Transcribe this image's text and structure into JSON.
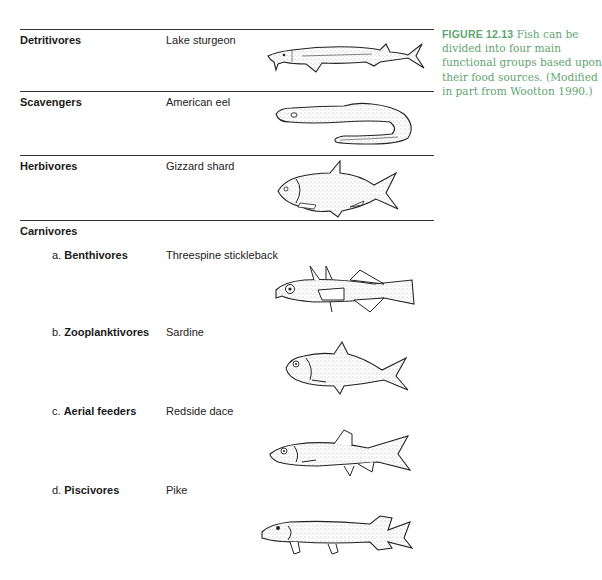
{
  "figure": {
    "caption": {
      "label": "FIGURE 12.13",
      "text": " Fish can be divided into four main functional groups based upon their food sources. (Modified in part from Wootton 1990.)"
    },
    "accent_color": "#5fa571"
  },
  "groups": [
    {
      "label": "Detritivores",
      "species": "Lake sturgeon",
      "icon": "sturgeon-illustration"
    },
    {
      "label": "Scavengers",
      "species": "American eel",
      "icon": "eel-illustration"
    },
    {
      "label": "Herbivores",
      "species": "Gizzard shard",
      "icon": "gizzard-shad-illustration"
    },
    {
      "label": "Carnivores"
    }
  ],
  "carnivores": [
    {
      "prefix": "a. ",
      "label": "Benthivores",
      "species": "Threespine stickleback",
      "icon": "stickleback-illustration"
    },
    {
      "prefix": "b. ",
      "label": "Zooplanktivores",
      "species": "Sardine",
      "icon": "sardine-illustration"
    },
    {
      "prefix": "c. ",
      "label": "Aerial feeders",
      "species": "Redside dace",
      "icon": "dace-illustration"
    },
    {
      "prefix": "d. ",
      "label": "Piscivores",
      "species": "Pike",
      "icon": "pike-illustration"
    }
  ]
}
